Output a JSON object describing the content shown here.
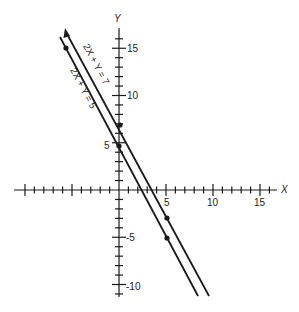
{
  "chart_data": {
    "type": "line",
    "title": "",
    "xlabel": "X",
    "ylabel": "Y",
    "xlim": [
      -11,
      17
    ],
    "ylim": [
      -11,
      17
    ],
    "grid": false,
    "x_tick_labels": [
      "5",
      "10",
      "15"
    ],
    "y_tick_labels": [
      "15",
      "10",
      "5",
      "-5",
      "-10"
    ],
    "series": [
      {
        "name": "2X + Y = 7",
        "equation": "2X + Y = 7",
        "slope": -2,
        "intercept": 7,
        "marked_points": [
          [
            0,
            7
          ],
          [
            5,
            -3
          ]
        ],
        "arrow_at_top": true
      },
      {
        "name": "2X + Y = 5",
        "equation": "2X + Y = 5",
        "slope": -2,
        "intercept": 5,
        "marked_points": [
          [
            -5,
            15
          ],
          [
            0,
            5
          ],
          [
            5,
            -5
          ]
        ],
        "arrow_at_top": false
      }
    ]
  },
  "labels": {
    "x_axis": "X",
    "y_axis": "Y",
    "line7": "2X + Y = 7",
    "line5": "2X + Y = 5",
    "xtick5": "5",
    "xtick10": "10",
    "xtick15": "15",
    "ytick15": "15",
    "ytick10": "10",
    "ytick5": "5",
    "ytickm5": "-5",
    "ytickm10": "-10"
  },
  "colors": {
    "ink": "#1a1a1a",
    "background": "#ffffff"
  }
}
